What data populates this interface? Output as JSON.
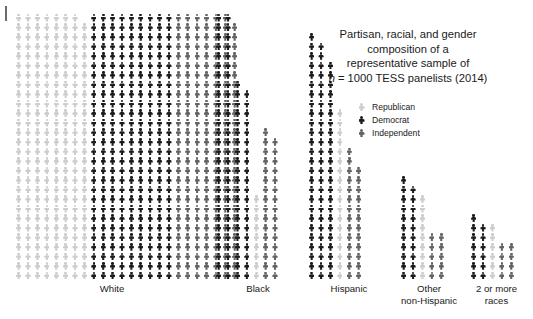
{
  "page": {
    "background_color": "#ffffff",
    "margin_tick_color": "#6b6b6b"
  },
  "title": {
    "lines": [
      "Partisan, racial, and gender",
      "composition of a",
      "representative sample of"
    ],
    "stat_line_prefix": "n",
    "stat_line_rest": " = 1000 TESS panelists (2014)"
  },
  "legend": {
    "items": [
      {
        "label": "Republican",
        "icon": "person-icon",
        "color": "#cdcdcd",
        "key": "rep"
      },
      {
        "label": "Democrat",
        "icon": "person-icon",
        "color": "#1c1c1c",
        "key": "dem"
      },
      {
        "label": "Independent",
        "icon": "person-icon",
        "color": "#636363",
        "key": "ind"
      }
    ]
  },
  "axis": {
    "labels": [
      {
        "text": "White",
        "left": 0,
        "width": 196
      },
      {
        "text": "Black",
        "left": 196,
        "width": 96
      },
      {
        "text": "Hispanic",
        "left": 292,
        "width": 86
      },
      {
        "text": "Other\nnon-Hispanic",
        "left": 378,
        "width": 74
      },
      {
        "text": "2 or more\nraces",
        "left": 452,
        "width": 61
      }
    ]
  },
  "chart_data": {
    "type": "waffle",
    "title": "Partisan, racial, and gender composition of a representative sample of n = 1000 TESS panelists (2014)",
    "unit": "1 icon = 1 panelist",
    "total_n": 1000,
    "xlabel": "",
    "ylabel": "",
    "grid": false,
    "legend_position": "top-right",
    "categories": [
      "White",
      "Black",
      "Hispanic",
      "Other non-Hispanic",
      "2 or more races"
    ],
    "series": [
      {
        "name": "Republican",
        "color": "#cdcdcd",
        "values": [
          231,
          9,
          18,
          9,
          6
        ]
      },
      {
        "name": "Democrat",
        "color": "#1c1c1c",
        "values": [
          252,
          97,
          74,
          21,
          13
        ]
      },
      {
        "name": "Independent",
        "color": "#636363",
        "values": [
          195,
          31,
          26,
          10,
          8
        ]
      }
    ],
    "columns": [
      {
        "group": "White",
        "party": "rep",
        "count": 28
      },
      {
        "group": "White",
        "party": "rep",
        "count": 28
      },
      {
        "group": "White",
        "party": "rep",
        "count": 28
      },
      {
        "group": "White",
        "party": "rep",
        "count": 28
      },
      {
        "group": "White",
        "party": "rep",
        "count": 28
      },
      {
        "group": "White",
        "party": "rep",
        "count": 28
      },
      {
        "group": "White",
        "party": "rep",
        "count": 28
      },
      {
        "group": "White",
        "party": "rep",
        "count": 27
      },
      {
        "group": "White",
        "party": "dem",
        "count": 28
      },
      {
        "group": "White",
        "party": "dem",
        "count": 28
      },
      {
        "group": "White",
        "party": "dem",
        "count": 28
      },
      {
        "group": "White",
        "party": "dem",
        "count": 28
      },
      {
        "group": "White",
        "party": "dem",
        "count": 28
      },
      {
        "group": "White",
        "party": "dem",
        "count": 28
      },
      {
        "group": "White",
        "party": "dem",
        "count": 28
      },
      {
        "group": "White",
        "party": "dem",
        "count": 28
      },
      {
        "group": "White",
        "party": "dem",
        "count": 28
      },
      {
        "group": "White",
        "party": "ind",
        "count": 28
      },
      {
        "group": "White",
        "party": "ind",
        "count": 28
      },
      {
        "group": "White",
        "party": "ind",
        "count": 28
      },
      {
        "group": "White",
        "party": "ind",
        "count": 28
      },
      {
        "group": "White",
        "party": "ind",
        "count": 28
      },
      {
        "group": "White",
        "party": "ind",
        "count": 28
      },
      {
        "group": "White",
        "party": "ind",
        "count": 27
      },
      {
        "group": "Black",
        "party": "dem",
        "count": 28
      },
      {
        "group": "Black",
        "party": "dem",
        "count": 28
      },
      {
        "group": "Black",
        "party": "dem",
        "count": 21
      },
      {
        "group": "Black",
        "party": "dem",
        "count": 20
      },
      {
        "group": "Black",
        "party": "rep",
        "count": 9
      },
      {
        "group": "Black",
        "party": "ind",
        "count": 16
      },
      {
        "group": "Black",
        "party": "ind",
        "count": 15
      },
      {
        "group": "Hispanic",
        "party": "dem",
        "count": 26
      },
      {
        "group": "Hispanic",
        "party": "dem",
        "count": 25
      },
      {
        "group": "Hispanic",
        "party": "dem",
        "count": 23
      },
      {
        "group": "Hispanic",
        "party": "rep",
        "count": 18
      },
      {
        "group": "Hispanic",
        "party": "ind",
        "count": 14
      },
      {
        "group": "Hispanic",
        "party": "ind",
        "count": 12
      },
      {
        "group": "Other non-Hispanic",
        "party": "dem",
        "count": 11
      },
      {
        "group": "Other non-Hispanic",
        "party": "dem",
        "count": 10
      },
      {
        "group": "Other non-Hispanic",
        "party": "rep",
        "count": 9
      },
      {
        "group": "Other non-Hispanic",
        "party": "ind",
        "count": 5
      },
      {
        "group": "Other non-Hispanic",
        "party": "ind",
        "count": 5
      },
      {
        "group": "2 or more races",
        "party": "dem",
        "count": 7
      },
      {
        "group": "2 or more races",
        "party": "dem",
        "count": 6
      },
      {
        "group": "2 or more races",
        "party": "rep",
        "count": 6
      },
      {
        "group": "2 or more races",
        "party": "ind",
        "count": 4
      },
      {
        "group": "2 or more races",
        "party": "ind",
        "count": 4
      }
    ],
    "group_layout": [
      {
        "name": "White",
        "left": 0
      },
      {
        "name": "Black",
        "left": 200
      },
      {
        "name": "Hispanic",
        "left": 293
      },
      {
        "name": "Other non-Hispanic",
        "left": 385
      },
      {
        "name": "2 or more races",
        "left": 455
      }
    ]
  }
}
